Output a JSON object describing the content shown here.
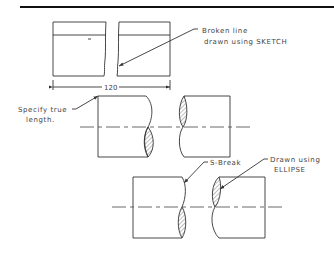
{
  "diagram": {
    "type": "technical-drawing",
    "annotations": {
      "broken_line_line1": "Broken line",
      "broken_line_line2": "drawn using SKETCH",
      "dimension_value": "120",
      "true_length_line1": "Specify true",
      "true_length_line2": "length.",
      "s_break": "S-Break",
      "ellipse_line1": "Drawn using",
      "ellipse_line2": "ELLIPSE"
    },
    "views": [
      {
        "name": "rectangular-bar-break",
        "description": "Two rectangular sections separated by freehand broken line"
      },
      {
        "name": "cylinder-s-break-1",
        "description": "Round bar with S-break and hatched lobes"
      },
      {
        "name": "cylinder-s-break-2",
        "description": "Round bar with S-break; lobes drawn using ELLIPSE"
      }
    ],
    "colors": {
      "line": "#333333",
      "background": "#ffffff"
    }
  }
}
